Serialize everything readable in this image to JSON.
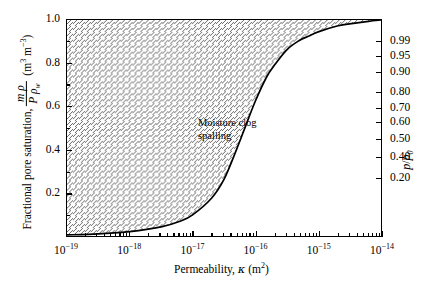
{
  "axes": {
    "x": {
      "title_text": "Permeability, ",
      "title_symbol": "κ",
      "title_units": "(m",
      "title_units_sup": "2",
      "title_units_close": ")",
      "ticks": [
        {
          "exp": "−19",
          "pos": 0.0
        },
        {
          "exp": "−18",
          "pos": 0.2
        },
        {
          "exp": "−17",
          "pos": 0.4
        },
        {
          "exp": "−16",
          "pos": 0.6
        },
        {
          "exp": "−15",
          "pos": 0.8
        },
        {
          "exp": "−14",
          "pos": 1.0
        }
      ],
      "base": "10",
      "range_min_exp": -19,
      "range_max_exp": -14,
      "scale": "log"
    },
    "y_left": {
      "title_prefix": "Fractional pore saturation, ",
      "frac_num": "m ρ",
      "frac_den_p": "P",
      "frac_den_rho": "ρ",
      "frac_den_sub": "w",
      "units_open": "(m",
      "units_sup1": "3",
      "units_mid": " m",
      "units_sup2": "−3",
      "units_close": ")",
      "ticks": [
        {
          "label": "1.0",
          "value": 1.0
        },
        {
          "label": "0.8",
          "value": 0.8
        },
        {
          "label": "0.6",
          "value": 0.6
        },
        {
          "label": "0.4",
          "value": 0.4
        },
        {
          "label": "0.2",
          "value": 0.2
        }
      ],
      "minor_values": [
        0.9,
        0.7,
        0.5,
        0.3,
        0.1
      ],
      "range": [
        0.0,
        1.0
      ]
    },
    "y_right": {
      "title_num": "p",
      "title_den": "p",
      "title_sub": "0",
      "ticks": [
        {
          "label": "0.99",
          "value": 0.99,
          "pos": 0.901
        },
        {
          "label": "0.95",
          "value": 0.95,
          "pos": 0.83
        },
        {
          "label": "0.90",
          "value": 0.9,
          "pos": 0.757
        },
        {
          "label": "0.80",
          "value": 0.8,
          "pos": 0.664
        },
        {
          "label": "0.70",
          "value": 0.7,
          "pos": 0.592
        },
        {
          "label": "0.60",
          "value": 0.6,
          "pos": 0.528
        },
        {
          "label": "0.50",
          "value": 0.5,
          "pos": 0.45
        },
        {
          "label": "0.40",
          "value": 0.4,
          "pos": 0.367
        },
        {
          "label": "0.20",
          "value": 0.2,
          "pos": 0.27
        }
      ]
    }
  },
  "annotation": {
    "line1": "Moisture clog",
    "line2": "spalling"
  },
  "chart_data": {
    "type": "area",
    "title": "",
    "xlabel": "Permeability, κ (m2)",
    "ylabel": "Fractional pore saturation, m ρ / P ρw (m3 m-3)",
    "ylabel_right": "p/p0",
    "xscale": "log",
    "xlim": [
      1e-19,
      1e-14
    ],
    "ylim": [
      0,
      1
    ],
    "grid": false,
    "legend": null,
    "fill": "hatched-diagonal-upward",
    "fill_region": "above-curve",
    "series": [
      {
        "name": "Moisture clog spalling boundary",
        "x": [
          1e-19,
          3.16e-19,
          1e-18,
          3.16e-18,
          6.3e-18,
          1e-17,
          2e-17,
          3.16e-17,
          5e-17,
          7e-17,
          1e-16,
          1.5e-16,
          2e-16,
          3.16e-16,
          5e-16,
          7e-16,
          1e-15,
          2e-15,
          3.16e-15,
          6.3e-15,
          1e-14
        ],
        "y": [
          0.005,
          0.01,
          0.02,
          0.042,
          0.068,
          0.098,
          0.175,
          0.262,
          0.4,
          0.51,
          0.625,
          0.735,
          0.79,
          0.862,
          0.905,
          0.925,
          0.945,
          0.972,
          0.982,
          0.994,
          1.0
        ]
      }
    ],
    "annotations": [
      {
        "text": "Moisture clog spalling",
        "x": 3.5e-18,
        "y": 0.57
      }
    ]
  },
  "style": {
    "axis_color": "#000000",
    "curve_color": "#000000",
    "hatch_color": "#555555",
    "background": "#ffffff"
  }
}
